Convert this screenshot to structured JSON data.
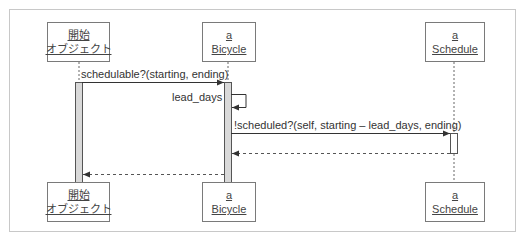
{
  "diagram": {
    "type": "sequence-diagram",
    "lifelines": [
      {
        "id": "origin",
        "line1": "開始",
        "line2": "オブジェクト"
      },
      {
        "id": "bicycle",
        "line1": "a",
        "line2": "Bicycle"
      },
      {
        "id": "schedule",
        "line1": "a",
        "line2": "Schedule"
      }
    ],
    "messages": [
      {
        "from": "origin",
        "to": "bicycle",
        "kind": "call",
        "label": "schedulable?(starting, ending)"
      },
      {
        "from": "bicycle",
        "to": "bicycle",
        "kind": "self-call",
        "label": "lead_days"
      },
      {
        "from": "bicycle",
        "to": "schedule",
        "kind": "call",
        "label": "!scheduled?(self, starting – lead_days, ending)"
      },
      {
        "from": "schedule",
        "to": "bicycle",
        "kind": "return",
        "label": ""
      },
      {
        "from": "bicycle",
        "to": "origin",
        "kind": "return",
        "label": ""
      }
    ],
    "colors": {
      "frame_border": "#c8c8c8",
      "box_border": "#7a7a7a",
      "line": "#555555",
      "activation_fill": "#d9d9d9",
      "text": "#333333"
    }
  },
  "caption": {
    "text": ""
  }
}
